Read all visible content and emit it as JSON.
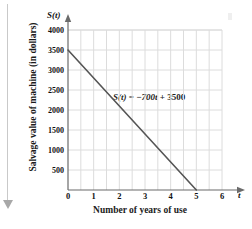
{
  "chart_data": {
    "type": "line",
    "title": "",
    "xlabel": "Number of years of use",
    "ylabel": "Salvage value of machine (in dollars)",
    "x_axis_symbol": "t",
    "y_axis_symbol": "S(t)",
    "annotation": "S(t) = −700t + 3500",
    "annotation_parts": {
      "func": "S(t)",
      "equals": "=",
      "slope_term": "−700t",
      "plus": "+",
      "intercept": "3500"
    },
    "xlim": [
      0,
      6
    ],
    "ylim": [
      0,
      4000
    ],
    "xticks": [
      0,
      1,
      2,
      3,
      4,
      5,
      6
    ],
    "xtick_labels": [
      "0",
      "1",
      "2",
      "3",
      "4",
      "5",
      "6"
    ],
    "yticks": [
      500,
      1000,
      1500,
      2000,
      2500,
      3000,
      3500,
      4000
    ],
    "ytick_labels": [
      "500",
      "1000",
      "1500",
      "2000",
      "2500",
      "3000",
      "3500",
      "4000"
    ],
    "grid": true,
    "grid_color": "#dcdcdc",
    "legend": "none",
    "series": [
      {
        "name": "S(t) = -700t + 3500",
        "color": "#555555",
        "slope": -700,
        "intercept": 3500,
        "x": [
          0,
          5
        ],
        "values": [
          3500,
          0
        ],
        "points": [
          {
            "x": 0,
            "y": 3500
          },
          {
            "x": 1,
            "y": 2800
          },
          {
            "x": 2,
            "y": 2100
          },
          {
            "x": 3,
            "y": 1400
          },
          {
            "x": 4,
            "y": 700
          },
          {
            "x": 5,
            "y": 0
          }
        ]
      }
    ]
  },
  "colors": {
    "axis": "#6b6b6b",
    "line": "#555555",
    "grid": "#dcdcdc",
    "text": "#111111",
    "margin_rule": "#c9c9c9"
  }
}
